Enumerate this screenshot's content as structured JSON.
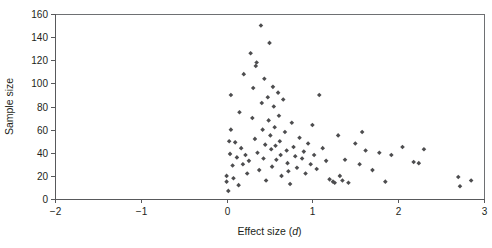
{
  "chart_data": {
    "type": "scatter",
    "title": "",
    "xlabel": "Effect size (d)",
    "xlabel_plain": "Effect size (",
    "xlabel_italic": "d",
    "xlabel_close": ")",
    "ylabel": "Sample size",
    "xlim": [
      -2,
      3
    ],
    "ylim": [
      0,
      160
    ],
    "xticks": [
      -2,
      -1,
      0,
      1,
      2,
      3
    ],
    "xtick_labels": [
      "−2",
      "−1",
      "0",
      "1",
      "2",
      "3"
    ],
    "yticks": [
      0,
      20,
      40,
      60,
      80,
      100,
      120,
      140,
      160
    ],
    "ytick_labels": [
      "0",
      "20",
      "40",
      "60",
      "80",
      "100",
      "120",
      "140",
      "160"
    ],
    "grid": false,
    "legend": null,
    "marker": "diamond",
    "marker_color": "#4d4d4f",
    "marker_size": 4.6,
    "n_points": 95,
    "points": [
      [
        0.0,
        20
      ],
      [
        0.0,
        15
      ],
      [
        0.02,
        7
      ],
      [
        0.03,
        50
      ],
      [
        0.04,
        39
      ],
      [
        0.05,
        60
      ],
      [
        0.05,
        90
      ],
      [
        0.07,
        29
      ],
      [
        0.08,
        18
      ],
      [
        0.1,
        49
      ],
      [
        0.12,
        36
      ],
      [
        0.14,
        12
      ],
      [
        0.15,
        75
      ],
      [
        0.17,
        44
      ],
      [
        0.19,
        30
      ],
      [
        0.2,
        108
      ],
      [
        0.22,
        38
      ],
      [
        0.24,
        22
      ],
      [
        0.26,
        33
      ],
      [
        0.28,
        126
      ],
      [
        0.3,
        70
      ],
      [
        0.31,
        96
      ],
      [
        0.33,
        52
      ],
      [
        0.34,
        115
      ],
      [
        0.35,
        118
      ],
      [
        0.36,
        40
      ],
      [
        0.38,
        25
      ],
      [
        0.4,
        150
      ],
      [
        0.41,
        83
      ],
      [
        0.42,
        60
      ],
      [
        0.43,
        35
      ],
      [
        0.44,
        104
      ],
      [
        0.45,
        47
      ],
      [
        0.46,
        16
      ],
      [
        0.48,
        88
      ],
      [
        0.49,
        68
      ],
      [
        0.5,
        135
      ],
      [
        0.51,
        55
      ],
      [
        0.52,
        43
      ],
      [
        0.53,
        28
      ],
      [
        0.54,
        97
      ],
      [
        0.55,
        80
      ],
      [
        0.56,
        62
      ],
      [
        0.57,
        46
      ],
      [
        0.58,
        34
      ],
      [
        0.6,
        92
      ],
      [
        0.61,
        72
      ],
      [
        0.62,
        50
      ],
      [
        0.63,
        38
      ],
      [
        0.64,
        20
      ],
      [
        0.66,
        86
      ],
      [
        0.68,
        58
      ],
      [
        0.7,
        42
      ],
      [
        0.71,
        31
      ],
      [
        0.72,
        24
      ],
      [
        0.74,
        13
      ],
      [
        0.76,
        66
      ],
      [
        0.78,
        45
      ],
      [
        0.8,
        37
      ],
      [
        0.82,
        27
      ],
      [
        0.85,
        53
      ],
      [
        0.88,
        35
      ],
      [
        0.9,
        41
      ],
      [
        0.92,
        22
      ],
      [
        0.95,
        48
      ],
      [
        0.98,
        30
      ],
      [
        1.0,
        64
      ],
      [
        1.02,
        38
      ],
      [
        1.05,
        26
      ],
      [
        1.08,
        90
      ],
      [
        1.12,
        44
      ],
      [
        1.16,
        33
      ],
      [
        1.2,
        17
      ],
      [
        1.24,
        15
      ],
      [
        1.26,
        14
      ],
      [
        1.3,
        55
      ],
      [
        1.32,
        20
      ],
      [
        1.35,
        16
      ],
      [
        1.38,
        34
      ],
      [
        1.42,
        14
      ],
      [
        1.5,
        48
      ],
      [
        1.55,
        30
      ],
      [
        1.58,
        58
      ],
      [
        1.62,
        42
      ],
      [
        1.7,
        25
      ],
      [
        1.78,
        40
      ],
      [
        1.85,
        15
      ],
      [
        1.92,
        38
      ],
      [
        2.05,
        45
      ],
      [
        2.18,
        32
      ],
      [
        2.24,
        31
      ],
      [
        2.3,
        43
      ],
      [
        2.7,
        19
      ],
      [
        2.72,
        11
      ],
      [
        2.85,
        16
      ]
    ]
  },
  "geometry": {
    "plot_left": 55,
    "plot_right": 484,
    "plot_top": 14,
    "plot_bottom": 199
  }
}
